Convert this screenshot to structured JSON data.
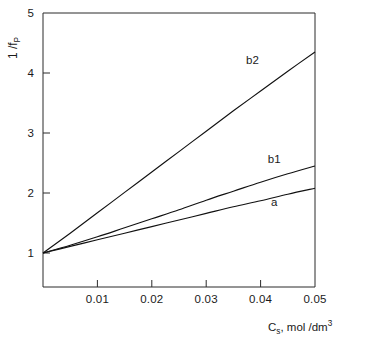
{
  "chart_data": {
    "type": "line",
    "title": "",
    "subtitle": "",
    "xlabel": "C_s, mol/dm^3",
    "xlabel_parts": {
      "base": "C",
      "sub": "s",
      "rest": ", mol /dm",
      "sup": "3"
    },
    "ylabel": "1/f_P",
    "ylabel_parts": {
      "num": "1",
      "slash": "/",
      "den": "f",
      "den_sub": "P"
    },
    "xlim": [
      0,
      0.05
    ],
    "ylim": [
      1,
      5
    ],
    "xticks": [
      0.01,
      0.02,
      0.03,
      0.04,
      0.05
    ],
    "xtick_labels": [
      "0.01",
      "0.02",
      "0.03",
      "0.04",
      "0.05"
    ],
    "yticks": [
      1,
      2,
      3,
      4,
      5
    ],
    "ytick_labels": [
      "1",
      "2",
      "3",
      "4",
      "5"
    ],
    "grid": false,
    "legend": "inline-curve-labels",
    "series": [
      {
        "name": "a",
        "label": "a",
        "label_x": 0.0425,
        "label_y": 1.78,
        "x": [
          0.0,
          0.005,
          0.01,
          0.015,
          0.02,
          0.025,
          0.03,
          0.035,
          0.04,
          0.045,
          0.05
        ],
        "y": [
          1.0,
          1.11,
          1.22,
          1.33,
          1.44,
          1.55,
          1.66,
          1.77,
          1.87,
          1.98,
          2.08
        ]
      },
      {
        "name": "b1",
        "label": "b1",
        "label_x": 0.0425,
        "label_y": 2.5,
        "x": [
          0.0,
          0.005,
          0.01,
          0.015,
          0.02,
          0.025,
          0.03,
          0.035,
          0.04,
          0.045,
          0.05
        ],
        "y": [
          1.0,
          1.13,
          1.27,
          1.42,
          1.57,
          1.72,
          1.88,
          2.03,
          2.18,
          2.32,
          2.45
        ]
      },
      {
        "name": "b2",
        "label": "b2",
        "label_x": 0.0385,
        "label_y": 4.15,
        "x": [
          0.0,
          0.005,
          0.01,
          0.015,
          0.02,
          0.025,
          0.03,
          0.035,
          0.04,
          0.045,
          0.05
        ],
        "y": [
          1.0,
          1.33,
          1.67,
          2.01,
          2.35,
          2.69,
          3.03,
          3.37,
          3.7,
          4.03,
          4.35
        ]
      }
    ],
    "colors": {
      "axis": "#2b2b2b",
      "curve": "#111111",
      "background": "#ffffff"
    }
  }
}
